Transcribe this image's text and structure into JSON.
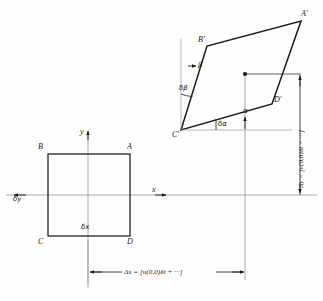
{
  "figure": {
    "colors": {
      "ink": "#1a1a1a",
      "axis": "#777777",
      "background": "#fefefe"
    },
    "undeformed_square": {
      "vertex_labels": {
        "top_left": "B",
        "top_right": "A",
        "bottom_left": "C",
        "bottom_right": "D"
      },
      "side_labels": {
        "horizontal": "δx",
        "vertical": "δy"
      },
      "axis_labels": {
        "x": "x",
        "y": "y"
      }
    },
    "deformed_parallelogram": {
      "vertex_labels": {
        "top_left": "B′",
        "top_right": "A′",
        "bottom_left": "C′",
        "bottom_right": "D′"
      },
      "angle_labels": {
        "beta": "β",
        "delta_beta": "δβ",
        "alpha": "α",
        "delta_alpha": "δα"
      }
    },
    "dimensions": {
      "delta_x": "Δx = [u(0,0)δt + ···]",
      "delta_y": "Δy = [v(0,0)δt + ···]"
    }
  }
}
